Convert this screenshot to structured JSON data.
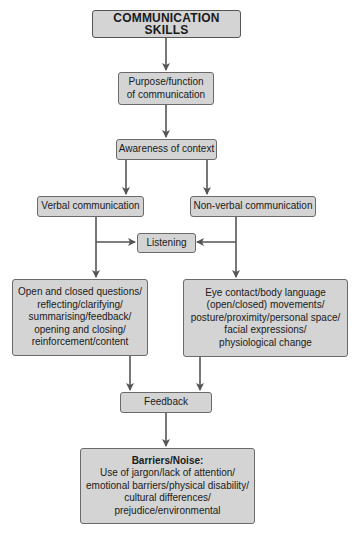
{
  "diagram": {
    "title": "COMMUNICATION SKILLS",
    "nodes": {
      "purpose": [
        "Purpose/function",
        "of communication"
      ],
      "awareness": "Awareness of context",
      "verbal": "Verbal communication",
      "nonverbal": "Non-verbal communication",
      "listening": "Listening",
      "verbal_skills": [
        "Open and closed questions/",
        "reflecting/clarifying/",
        "summarising/feedback/",
        "opening and closing/",
        "reinforcement/content"
      ],
      "nonverbal_skills": [
        "Eye contact/body language",
        "(open/closed) movements/",
        "posture/proximity/personal space/",
        "facial expressions/",
        "physiological change"
      ],
      "feedback": "Feedback",
      "barriers": {
        "heading": "Barriers/Noise:",
        "lines": [
          "Use of jargon/lack of attention/",
          "emotional barriers/physical disability/",
          "cultural differences/",
          "prejudice/environmental"
        ]
      }
    },
    "edges": [
      [
        "title",
        "purpose"
      ],
      [
        "purpose",
        "awareness"
      ],
      [
        "awareness",
        "verbal"
      ],
      [
        "awareness",
        "nonverbal"
      ],
      [
        "verbal",
        "listening"
      ],
      [
        "nonverbal",
        "listening"
      ],
      [
        "verbal",
        "verbal_skills"
      ],
      [
        "nonverbal",
        "nonverbal_skills"
      ],
      [
        "verbal_skills",
        "feedback"
      ],
      [
        "nonverbal_skills",
        "feedback"
      ],
      [
        "feedback",
        "barriers"
      ]
    ],
    "colors": {
      "box_fill": "#d4d4d4",
      "box_border": "#6a6a6a",
      "arrow": "#555555"
    }
  }
}
